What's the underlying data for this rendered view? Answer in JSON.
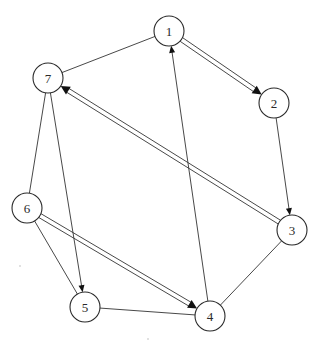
{
  "diagram": {
    "type": "directed-graph",
    "colors": {
      "stroke": "#333333",
      "node_fill": "#ffffff",
      "arrow": "#111111",
      "background": "#ffffff"
    },
    "node_radius": 15,
    "nodes": [
      {
        "id": "1",
        "label": "1",
        "x": 169,
        "y": 31
      },
      {
        "id": "2",
        "label": "2",
        "x": 274,
        "y": 103
      },
      {
        "id": "3",
        "label": "3",
        "x": 292,
        "y": 230
      },
      {
        "id": "4",
        "label": "4",
        "x": 210,
        "y": 316
      },
      {
        "id": "5",
        "label": "5",
        "x": 85,
        "y": 307
      },
      {
        "id": "6",
        "label": "6",
        "x": 27,
        "y": 208
      },
      {
        "id": "7",
        "label": "7",
        "x": 48,
        "y": 78
      }
    ],
    "edges": [
      {
        "from": "1",
        "to": "7",
        "style": "single",
        "directed": false
      },
      {
        "from": "7",
        "to": "6",
        "style": "single",
        "directed": false
      },
      {
        "from": "6",
        "to": "5",
        "style": "single",
        "directed": false
      },
      {
        "from": "5",
        "to": "4",
        "style": "single",
        "directed": false
      },
      {
        "from": "4",
        "to": "3",
        "style": "single",
        "directed": false
      },
      {
        "from": "4",
        "to": "1",
        "style": "single",
        "directed": true
      },
      {
        "from": "7",
        "to": "5",
        "style": "single",
        "directed": true
      },
      {
        "from": "2",
        "to": "3",
        "style": "single",
        "directed": true
      },
      {
        "from": "1",
        "to": "2",
        "style": "double",
        "directed": true
      },
      {
        "from": "3",
        "to": "7",
        "style": "double",
        "directed": true
      },
      {
        "from": "6",
        "to": "4",
        "style": "double",
        "directed": true
      }
    ]
  }
}
